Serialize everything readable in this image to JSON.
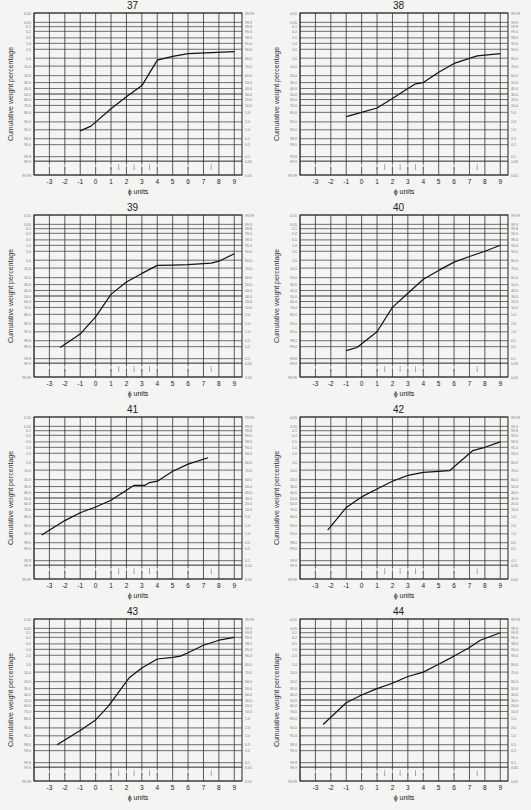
{
  "page": {
    "y_axis_label": "Cumulative weight percentage",
    "x_axis_label": "ϕ units"
  },
  "axes": {
    "x_ticks": [
      -3,
      -2,
      -1,
      0,
      1,
      2,
      3,
      4,
      5,
      6,
      7,
      8,
      9
    ],
    "x_range": [
      -4,
      9.5
    ],
    "left_ticks": [
      "0.01",
      "0.05",
      "0.1",
      "0.2",
      "0.5",
      "1.0",
      "2.0",
      "5.0",
      "10.0",
      "20.0",
      "30.0",
      "40.0",
      "50.0",
      "60.0",
      "70.0",
      "80.0",
      "90.0",
      "95.0",
      "98.0",
      "99.0",
      "99.8",
      "99.9",
      "99.99"
    ],
    "right_ticks": [
      "99.99",
      "99.9",
      "99.8",
      "99.0",
      "98.0",
      "95.0",
      "90.0",
      "80.0",
      "70.0",
      "60.0",
      "50.0",
      "40.0",
      "30.0",
      "20.0",
      "10.0",
      "5.0",
      "2.0",
      "1.0",
      "0.5",
      "0.2",
      "0.1",
      "0.05",
      "0.01"
    ],
    "size_class_marks": [
      "-3",
      "-2",
      "0",
      "1",
      "1.5",
      "2",
      "2.5",
      "3",
      "3.5",
      "4",
      "6",
      "7.5"
    ]
  },
  "chart_data": [
    {
      "type": "line",
      "title": "37",
      "xlabel": "ϕ units",
      "ylabel": "Cumulative weight percentage",
      "ylim": [
        0.01,
        99.99
      ],
      "grid": true,
      "x": [
        -1,
        -0.3,
        1,
        2,
        3,
        4,
        5,
        6,
        9
      ],
      "values": [
        95.5,
        93,
        75,
        55,
        35,
        6,
        4.2,
        3.2,
        2.6
      ]
    },
    {
      "type": "line",
      "title": "38",
      "xlabel": "ϕ units",
      "ylabel": "Cumulative weight percentage",
      "ylim": [
        0.01,
        99.99
      ],
      "grid": true,
      "x": [
        -1,
        0,
        1,
        2,
        3,
        3.5,
        4,
        5,
        6,
        7.5,
        9
      ],
      "values": [
        85,
        80,
        74,
        58,
        40,
        32,
        30,
        16,
        8,
        4,
        3.2
      ]
    },
    {
      "type": "line",
      "title": "39",
      "xlabel": "ϕ units",
      "ylabel": "Cumulative weight percentage",
      "ylim": [
        0.01,
        99.99
      ],
      "grid": true,
      "x": [
        -2.3,
        -1,
        0,
        1,
        2,
        3,
        4,
        5,
        6,
        7.5,
        8,
        9
      ],
      "values": [
        99.1,
        96,
        83,
        47,
        26,
        15,
        8,
        7.8,
        7.5,
        6.6,
        5.5,
        2.6
      ]
    },
    {
      "type": "line",
      "title": "40",
      "xlabel": "ϕ units",
      "ylabel": "Cumulative weight percentage",
      "ylim": [
        0.01,
        99.99
      ],
      "grid": true,
      "x": [
        -1,
        -0.3,
        1,
        2,
        3,
        4,
        5,
        6,
        7,
        8,
        9
      ],
      "values": [
        99.4,
        99.1,
        95,
        70,
        45,
        22,
        12,
        6,
        3.5,
        2,
        1
      ]
    },
    {
      "type": "line",
      "title": "41",
      "xlabel": "ϕ units",
      "ylabel": "Cumulative weight percentage",
      "ylim": [
        0.01,
        99.99
      ],
      "grid": true,
      "x": [
        -3.5,
        -2,
        -1,
        0,
        1,
        2,
        2.5,
        3.2,
        3.5,
        4,
        5,
        6,
        7.3
      ],
      "values": [
        95.5,
        85,
        75,
        66,
        54,
        36,
        28,
        28,
        24,
        22,
        11,
        6,
        3.2
      ]
    },
    {
      "type": "line",
      "title": "42",
      "xlabel": "ϕ units",
      "ylabel": "Cumulative weight percentage",
      "ylim": [
        0.01,
        99.99
      ],
      "grid": true,
      "x": [
        -2.2,
        -1,
        0,
        1,
        2,
        3,
        4,
        5,
        5.7,
        7.2,
        8,
        9
      ],
      "values": [
        93,
        67,
        48,
        34,
        22,
        15,
        12,
        11,
        10.5,
        1.5,
        1,
        0.5
      ]
    },
    {
      "type": "line",
      "title": "43",
      "xlabel": "ϕ units",
      "ylabel": "Cumulative weight percentage",
      "ylim": [
        0.01,
        99.99
      ],
      "grid": true,
      "x": [
        -2.5,
        -1,
        0,
        0.8,
        2.2,
        3,
        4,
        5,
        5.5,
        6,
        7,
        8,
        9
      ],
      "values": [
        98,
        92,
        82,
        62,
        15,
        7,
        3,
        2.5,
        2.2,
        1.5,
        0.6,
        0.3,
        0.2
      ]
    },
    {
      "type": "line",
      "title": "44",
      "xlabel": "ϕ units",
      "ylabel": "Cumulative weight percentage",
      "ylim": [
        0.01,
        99.99
      ],
      "grid": true,
      "x": [
        -2.5,
        -1,
        0,
        1,
        2,
        3,
        4,
        5,
        6,
        7,
        7.7,
        9
      ],
      "values": [
        87,
        55,
        41,
        30,
        22,
        14,
        10,
        5,
        2.2,
        0.8,
        0.3,
        0.1
      ]
    }
  ],
  "layout": {
    "panels": [
      {
        "left": 0,
        "top": 0
      },
      {
        "left": 266,
        "top": 0
      },
      {
        "left": 0,
        "top": 202
      },
      {
        "left": 266,
        "top": 202
      },
      {
        "left": 0,
        "top": 404
      },
      {
        "left": 266,
        "top": 404
      },
      {
        "left": 0,
        "top": 606
      },
      {
        "left": 266,
        "top": 606
      }
    ]
  }
}
